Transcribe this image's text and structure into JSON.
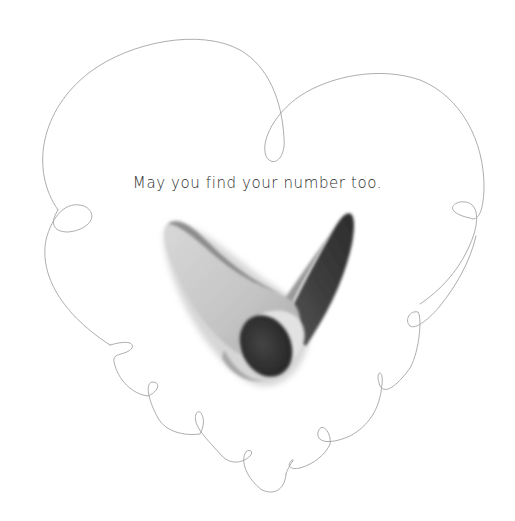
{
  "page": {
    "caption": "May you find your number too.",
    "background_color": "#ffffff",
    "text_color": "#2b2b2b"
  },
  "illustration": {
    "outline": "loopy-heart-outline",
    "outline_color": "#9a9a9a",
    "shape": "v-shaped-number-figure",
    "shape_colors": {
      "light": "#c9c9c9",
      "mid": "#8f8f8f",
      "dark": "#3a3a3a",
      "darkest": "#2a2a2a"
    }
  }
}
